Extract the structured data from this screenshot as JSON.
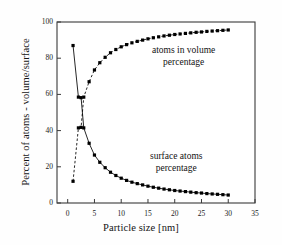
{
  "chart_data": {
    "type": "line",
    "title": "",
    "xlabel": "Particle size [nm]",
    "ylabel": "Percent of atoms - volume/surface",
    "xlim": [
      -2,
      35
    ],
    "ylim": [
      0,
      100
    ],
    "xticks": [
      0,
      5,
      10,
      15,
      20,
      25,
      30,
      35
    ],
    "yticks": [
      0,
      20,
      40,
      60,
      80,
      100
    ],
    "grid": false,
    "legend_position": "inline-annotations",
    "annotations": [
      {
        "name": "volume-annotation",
        "text_line1": "atoms in volume",
        "text_line2": "percentage",
        "x": 17,
        "y": 78
      },
      {
        "name": "surface-annotation",
        "text_line1": "surface atoms",
        "text_line2": "percentage",
        "x": 17,
        "y": 27
      }
    ],
    "series": [
      {
        "name": "atoms in volume percentage",
        "style": "dashed",
        "marker": "square",
        "color": "#000000",
        "x": [
          1,
          2,
          2.5,
          3,
          4,
          5,
          6,
          7,
          8,
          9,
          10,
          11,
          12,
          13,
          14,
          15,
          16,
          17,
          18,
          19,
          20,
          21,
          22,
          23,
          24,
          25,
          26,
          27,
          28,
          29,
          30
        ],
        "y": [
          12.0,
          41.5,
          41.8,
          58.5,
          67.0,
          73.5,
          77.5,
          80.5,
          83.0,
          84.8,
          86.3,
          87.5,
          88.5,
          89.3,
          90.0,
          90.7,
          91.3,
          91.8,
          92.3,
          92.7,
          93.1,
          93.4,
          93.7,
          94.0,
          94.3,
          94.5,
          94.8,
          95.0,
          95.2,
          95.4,
          95.6
        ]
      },
      {
        "name": "surface atoms percentage",
        "style": "solid",
        "marker": "square",
        "color": "#000000",
        "x": [
          1,
          2,
          2.5,
          3,
          4,
          5,
          6,
          7,
          8,
          9,
          10,
          11,
          12,
          13,
          14,
          15,
          16,
          17,
          18,
          19,
          20,
          21,
          22,
          23,
          24,
          25,
          26,
          27,
          28,
          29,
          30
        ],
        "y": [
          87.0,
          58.5,
          58.2,
          41.5,
          33.0,
          26.5,
          22.5,
          19.5,
          17.0,
          15.2,
          13.7,
          12.5,
          11.5,
          10.7,
          10.0,
          9.3,
          8.7,
          8.2,
          7.7,
          7.3,
          6.9,
          6.6,
          6.3,
          6.0,
          5.7,
          5.5,
          5.2,
          5.0,
          4.8,
          4.6,
          4.4
        ]
      }
    ]
  },
  "axes": {
    "x_tick_labels": [
      "0",
      "5",
      "10",
      "15",
      "20",
      "25",
      "30",
      "35"
    ],
    "y_tick_labels": [
      "0",
      "20",
      "40",
      "60",
      "80",
      "100"
    ]
  }
}
